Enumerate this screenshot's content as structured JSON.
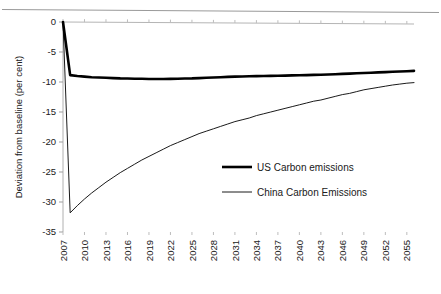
{
  "chart_data": {
    "type": "line",
    "title": "",
    "subtitle": "",
    "xlabel": "",
    "ylabel": "Deviation from baseline (per cent)",
    "xlim": [
      2007,
      2056
    ],
    "ylim": [
      -35,
      0
    ],
    "yticks": [
      0,
      -5,
      -10,
      -15,
      -20,
      -25,
      -30,
      -35
    ],
    "ytick_labels": [
      "0",
      "-5",
      "-10",
      "-15",
      "-20",
      "-25",
      "-30",
      "-35"
    ],
    "xticks": [
      2007,
      2010,
      2013,
      2016,
      2019,
      2022,
      2025,
      2028,
      2031,
      2034,
      2037,
      2040,
      2043,
      2046,
      2049,
      2052,
      2055
    ],
    "xtick_labels": [
      "2007",
      "2010",
      "2013",
      "2016",
      "2019",
      "2022",
      "2025",
      "2028",
      "2031",
      "2034",
      "2037",
      "2040",
      "2043",
      "2046",
      "2049",
      "2052",
      "2055"
    ],
    "grid": false,
    "legend_position": "center-right",
    "x": [
      2007,
      2008,
      2009,
      2010,
      2011,
      2012,
      2013,
      2014,
      2015,
      2016,
      2017,
      2018,
      2019,
      2020,
      2021,
      2022,
      2023,
      2024,
      2025,
      2026,
      2027,
      2028,
      2029,
      2030,
      2031,
      2032,
      2033,
      2034,
      2035,
      2036,
      2037,
      2038,
      2039,
      2040,
      2041,
      2042,
      2043,
      2044,
      2045,
      2046,
      2047,
      2048,
      2049,
      2050,
      2051,
      2052,
      2053,
      2054,
      2055,
      2056
    ],
    "series": [
      {
        "name": "US Carbon emissions",
        "color": "#000000",
        "line_width": 2.6,
        "values": [
          0,
          -8.85,
          -9.0,
          -9.1,
          -9.2,
          -9.25,
          -9.3,
          -9.35,
          -9.4,
          -9.42,
          -9.45,
          -9.47,
          -9.5,
          -9.5,
          -9.5,
          -9.48,
          -9.45,
          -9.42,
          -9.4,
          -9.35,
          -9.3,
          -9.25,
          -9.2,
          -9.15,
          -9.1,
          -9.08,
          -9.05,
          -9.02,
          -9.0,
          -8.98,
          -8.95,
          -8.93,
          -8.9,
          -8.88,
          -8.85,
          -8.82,
          -8.8,
          -8.75,
          -8.7,
          -8.65,
          -8.6,
          -8.55,
          -8.5,
          -8.45,
          -8.4,
          -8.35,
          -8.3,
          -8.25,
          -8.2,
          -8.15
        ]
      },
      {
        "name": "China Carbon Emissions",
        "color": "#000000",
        "line_width": 0.9,
        "values": [
          0,
          -31.8,
          -30.6,
          -29.5,
          -28.5,
          -27.6,
          -26.7,
          -25.9,
          -25.1,
          -24.4,
          -23.7,
          -23.0,
          -22.4,
          -21.8,
          -21.2,
          -20.6,
          -20.1,
          -19.6,
          -19.1,
          -18.6,
          -18.2,
          -17.8,
          -17.4,
          -17.0,
          -16.6,
          -16.3,
          -16.0,
          -15.6,
          -15.3,
          -15.0,
          -14.7,
          -14.4,
          -14.1,
          -13.8,
          -13.5,
          -13.2,
          -13.0,
          -12.7,
          -12.4,
          -12.1,
          -11.9,
          -11.6,
          -11.3,
          -11.1,
          -10.9,
          -10.7,
          -10.5,
          -10.35,
          -10.2,
          -10.1
        ]
      }
    ],
    "legend": [
      {
        "label": "US Carbon emissions",
        "swatch": "thick-line"
      },
      {
        "label": "China Carbon Emissions",
        "swatch": "thin-line"
      }
    ]
  }
}
